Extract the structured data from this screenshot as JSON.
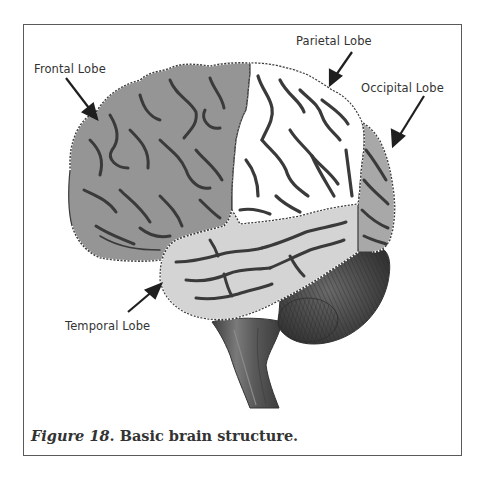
{
  "figure": {
    "caption_prefix": "Figure 18",
    "caption_text": ". Basic brain structure."
  },
  "labels": {
    "frontal": "Frontal Lobe",
    "parietal": "Parietal Lobe",
    "occipital": "Occipital Lobe",
    "temporal": "Temporal Lobe"
  },
  "colors": {
    "frontal_fill": "#959595",
    "parietal_fill": "#ffffff",
    "occipital_fill": "#a8a8a8",
    "temporal_fill": "#d4d4d4",
    "sulci": "#3a3a3a",
    "cerebellum": "#4a4a4a",
    "brainstem": "#555555",
    "border": "#5a5a5a"
  }
}
